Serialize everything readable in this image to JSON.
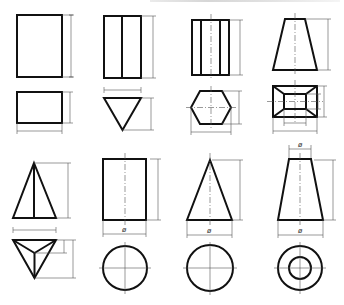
{
  "figure": {
    "title": "",
    "header_fragment": "cut-off text at top edge"
  },
  "solids": [
    {
      "name": "rectangular-block",
      "views": [
        "front",
        "top"
      ],
      "labels": []
    },
    {
      "name": "triangular-prism",
      "views": [
        "front",
        "top"
      ],
      "labels": []
    },
    {
      "name": "hexagonal-prism",
      "views": [
        "front",
        "top"
      ],
      "labels": []
    },
    {
      "name": "square-frustum",
      "views": [
        "front",
        "top"
      ],
      "labels": []
    },
    {
      "name": "triangular-pyramid",
      "views": [
        "front",
        "top"
      ],
      "labels": []
    },
    {
      "name": "cylinder",
      "views": [
        "front",
        "top"
      ],
      "labels": [
        "ø"
      ]
    },
    {
      "name": "cone",
      "views": [
        "front",
        "top"
      ],
      "labels": [
        "ø"
      ]
    },
    {
      "name": "cone-frustum",
      "views": [
        "front",
        "top"
      ],
      "labels": [
        "ø",
        "ø"
      ]
    }
  ],
  "symbols": {
    "diameter": "ø"
  },
  "colors": {
    "outline": "#111111",
    "thin_line": "#555555",
    "background": "#ffffff"
  }
}
